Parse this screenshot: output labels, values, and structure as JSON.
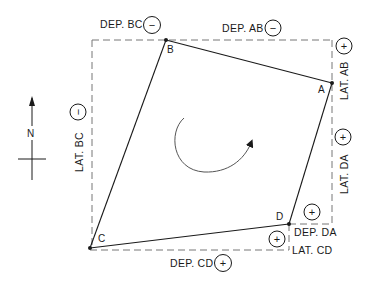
{
  "diagram": {
    "points": [
      {
        "id": "A",
        "label": "A",
        "x": 332,
        "y": 83
      },
      {
        "id": "B",
        "label": "B",
        "x": 166,
        "y": 40
      },
      {
        "id": "C",
        "label": "C",
        "x": 90,
        "y": 248
      },
      {
        "id": "D",
        "label": "D",
        "x": 289,
        "y": 224
      }
    ],
    "traverse_lines": [
      "A-B",
      "B-C",
      "C-D",
      "D-A"
    ],
    "north_arrow": {
      "label": "N"
    },
    "direction": "clockwise",
    "labels": {
      "dep_bc": "DEP. BC",
      "dep_ab": "DEP. AB",
      "lat_ab": "LAT. AB",
      "lat_bc": "LAT. BC",
      "lat_da": "LAT. DA",
      "dep_da": "DEP. DA",
      "lat_cd": "LAT. CD",
      "dep_cd": "DEP. CD"
    },
    "signs": {
      "dep_bc": "−",
      "dep_ab": "−",
      "lat_ab": "+",
      "lat_bc": "−",
      "lat_da": "+",
      "dep_da": "+",
      "lat_cd": "+",
      "dep_cd": "+"
    },
    "colors": {
      "line": "#1a1a1a",
      "dashed": "#777777",
      "background": "#ffffff"
    }
  }
}
